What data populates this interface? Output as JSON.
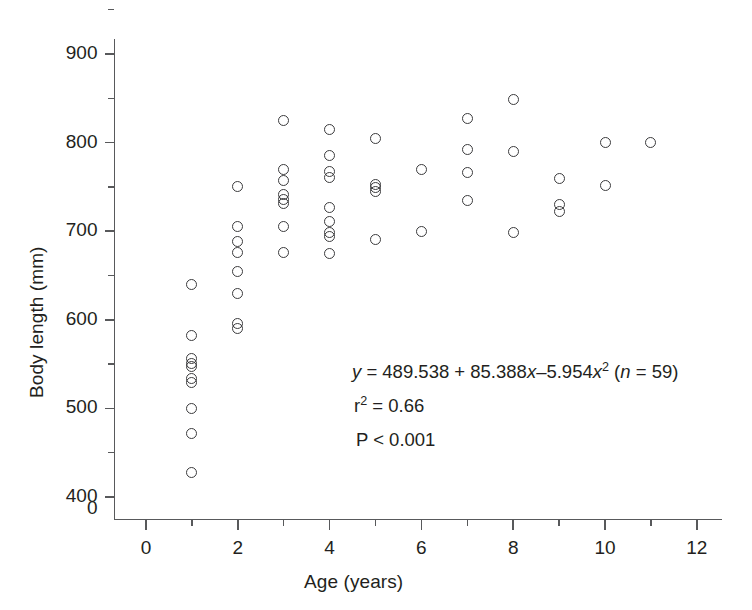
{
  "chart_data": {
    "type": "scatter",
    "title": "",
    "xlabel": "Age (years)",
    "ylabel": "Body length (mm)",
    "xlim": [
      -0.35,
      12.6
    ],
    "ylim": [
      395,
      912
    ],
    "grid": false,
    "legend": "none",
    "x_ticks_major": [
      0,
      2,
      4,
      6,
      8,
      10,
      12
    ],
    "x_ticks_minor": [
      1,
      3,
      5,
      7,
      9,
      11
    ],
    "x_tick_labels": [
      "0",
      "2",
      "4",
      "6",
      "8",
      "10",
      "12"
    ],
    "y_ticks_major": [
      400,
      500,
      600,
      700,
      800,
      900
    ],
    "y_ticks_minor": [
      450,
      550,
      650,
      750,
      850
    ],
    "y_tick_labels": [
      "400",
      "500",
      "600",
      "700",
      "800",
      "900"
    ],
    "y_axis_break_label": "0",
    "marker": "open-circle",
    "n_points": 59,
    "points": [
      {
        "x": 1,
        "y": 640
      },
      {
        "x": 1,
        "y": 582
      },
      {
        "x": 1,
        "y": 556
      },
      {
        "x": 1,
        "y": 551
      },
      {
        "x": 1,
        "y": 547
      },
      {
        "x": 1,
        "y": 534
      },
      {
        "x": 1,
        "y": 529
      },
      {
        "x": 1,
        "y": 500
      },
      {
        "x": 1,
        "y": 472
      },
      {
        "x": 1,
        "y": 428
      },
      {
        "x": 2,
        "y": 750
      },
      {
        "x": 2,
        "y": 705
      },
      {
        "x": 2,
        "y": 688
      },
      {
        "x": 2,
        "y": 676
      },
      {
        "x": 2,
        "y": 655
      },
      {
        "x": 2,
        "y": 630
      },
      {
        "x": 2,
        "y": 596
      },
      {
        "x": 2,
        "y": 590
      },
      {
        "x": 3,
        "y": 825
      },
      {
        "x": 3,
        "y": 770
      },
      {
        "x": 3,
        "y": 757
      },
      {
        "x": 3,
        "y": 741
      },
      {
        "x": 3,
        "y": 736
      },
      {
        "x": 3,
        "y": 731
      },
      {
        "x": 3,
        "y": 705
      },
      {
        "x": 3,
        "y": 676
      },
      {
        "x": 4,
        "y": 815
      },
      {
        "x": 4,
        "y": 785
      },
      {
        "x": 4,
        "y": 767
      },
      {
        "x": 4,
        "y": 761
      },
      {
        "x": 4,
        "y": 727
      },
      {
        "x": 4,
        "y": 711
      },
      {
        "x": 4,
        "y": 699
      },
      {
        "x": 4,
        "y": 694
      },
      {
        "x": 4,
        "y": 675
      },
      {
        "x": 5,
        "y": 805
      },
      {
        "x": 5,
        "y": 753
      },
      {
        "x": 5,
        "y": 749
      },
      {
        "x": 5,
        "y": 745
      },
      {
        "x": 5,
        "y": 691
      },
      {
        "x": 6,
        "y": 770
      },
      {
        "x": 6,
        "y": 700
      },
      {
        "x": 7,
        "y": 827
      },
      {
        "x": 7,
        "y": 792
      },
      {
        "x": 7,
        "y": 766
      },
      {
        "x": 7,
        "y": 735
      },
      {
        "x": 8,
        "y": 849
      },
      {
        "x": 8,
        "y": 790
      },
      {
        "x": 8,
        "y": 699
      },
      {
        "x": 9,
        "y": 760
      },
      {
        "x": 9,
        "y": 730
      },
      {
        "x": 9,
        "y": 722
      },
      {
        "x": 10,
        "y": 800
      },
      {
        "x": 10,
        "y": 752
      },
      {
        "x": 11,
        "y": 800
      }
    ],
    "annotations": {
      "equation_prefix": "y",
      "equation_body": " = 489.538 + 85.388",
      "equation_x1": "x",
      "equation_mid": "–5.954",
      "equation_x2": "x",
      "equation_exp": "2",
      "equation_n_open": " (",
      "equation_n_var": "n",
      "equation_n_value": " = 59)",
      "r_squared_var": "r",
      "r_squared_exp": "2",
      "r_squared_value": " = 0.66",
      "p_value": "P < 0.001"
    },
    "fit_model": "quadratic",
    "fit_coefficients": {
      "intercept": 489.538,
      "linear": 85.388,
      "quadratic": -5.954
    },
    "r_squared": 0.66,
    "p_value": "<0.001",
    "colors": {
      "axis": "#58595b",
      "marker_stroke": "#3b3b3d",
      "text": "#231f20",
      "background": "#ffffff"
    }
  }
}
